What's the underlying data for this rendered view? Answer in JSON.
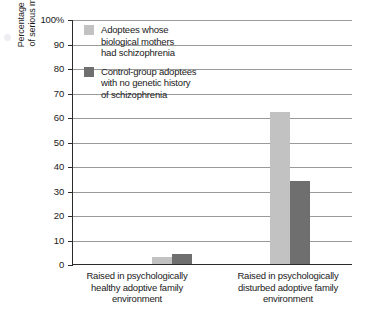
{
  "chart_data": {
    "type": "bar",
    "title": "",
    "xlabel": "",
    "ylabel": "Percentage showing signs of serious mental disorder",
    "ylabel_lines": [
      "Percentage showing signs",
      "of serious mental disorder"
    ],
    "ylim": [
      0,
      100
    ],
    "ytick_values": [
      0,
      10,
      20,
      30,
      40,
      50,
      60,
      70,
      80,
      90,
      100
    ],
    "ytick_labels": [
      "0",
      "10",
      "20",
      "30",
      "40",
      "50",
      "60",
      "70",
      "80",
      "90",
      "100%"
    ],
    "grid": true,
    "legend_position": "upper-left-inside",
    "categories": [
      "Raised in psychologically healthy adoptive family environment",
      "Raised in psychologically disturbed adoptive family environment"
    ],
    "category_lines": [
      [
        "Raised in psychologically",
        "healthy adoptive family",
        "environment"
      ],
      [
        "Raised in psychologically",
        "disturbed adoptive family",
        "environment"
      ]
    ],
    "series": [
      {
        "name": "Adoptees whose biological mothers had schizophrenia",
        "name_lines": [
          "Adoptees whose",
          "biological mothers",
          "had schizophrenia"
        ],
        "color": "#c2c2c2",
        "values": [
          3,
          62
        ]
      },
      {
        "name": "Control-group adoptees with no genetic history of schizophrenia",
        "name_lines": [
          "Control-group adoptees",
          "with no genetic history",
          "of schizophrenia"
        ],
        "color": "#6f6f6f",
        "values": [
          4,
          34
        ]
      }
    ]
  }
}
